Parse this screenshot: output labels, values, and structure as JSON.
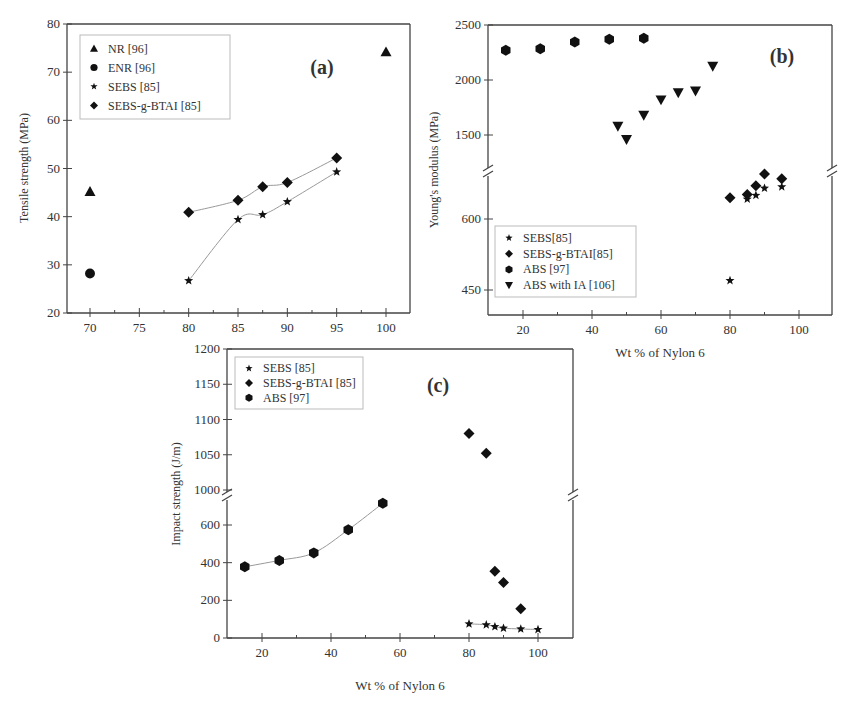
{
  "chart_data": [
    {
      "id": "a",
      "type": "scatter",
      "panel_label": "(a)",
      "title": "",
      "xlabel": "",
      "ylabel": "Tensile strength (MPa)",
      "xlim": [
        67.5,
        102.5
      ],
      "ylim": [
        20,
        80
      ],
      "xticks": [
        70,
        75,
        80,
        85,
        90,
        95,
        100
      ],
      "yticks": [
        20,
        30,
        40,
        50,
        60,
        70,
        80
      ],
      "grid": false,
      "legend_position": "upper-left",
      "series": [
        {
          "name": "NR [96]",
          "marker": "triangle-up",
          "points": [
            [
              70,
              45.2
            ],
            [
              100,
              74.2
            ]
          ]
        },
        {
          "name": "ENR [96]",
          "marker": "circle",
          "points": [
            [
              70,
              28.2
            ]
          ]
        },
        {
          "name": "SEBS [85]",
          "marker": "star",
          "points": [
            [
              80,
              26.7
            ],
            [
              85,
              39.4
            ],
            [
              87.5,
              40.4
            ],
            [
              90,
              43.1
            ],
            [
              95,
              49.3
            ]
          ],
          "fit_curve": true
        },
        {
          "name": "SEBS-g-BTAI [85]",
          "marker": "diamond",
          "points": [
            [
              80,
              40.9
            ],
            [
              85,
              43.4
            ],
            [
              87.5,
              46.2
            ],
            [
              90,
              47.1
            ],
            [
              95,
              52.2
            ]
          ],
          "fit_curve": true
        }
      ]
    },
    {
      "id": "b",
      "type": "scatter",
      "panel_label": "(b)",
      "title": "",
      "xlabel": "Wt % of Nylon 6",
      "ylabel": "Young's modulus (MPa)",
      "xlim": [
        10,
        110
      ],
      "ylim_broken": {
        "lower": [
          400,
          700
        ],
        "upper": [
          1300,
          2500
        ]
      },
      "xticks": [
        20,
        40,
        60,
        80,
        100
      ],
      "yticks": [
        450,
        600,
        1500,
        2000,
        2500
      ],
      "axis_break": true,
      "grid": false,
      "legend_position": "lower-left",
      "series": [
        {
          "name": "SEBS[85]",
          "marker": "star",
          "points": [
            [
              80,
              470
            ],
            [
              85,
              642
            ],
            [
              87.5,
              650
            ],
            [
              90,
              665
            ],
            [
              95,
              668
            ]
          ]
        },
        {
          "name": "SEBS-g-BTAI[85]",
          "marker": "diamond",
          "points": [
            [
              80,
              645
            ],
            [
              85,
              652
            ],
            [
              87.5,
              670
            ],
            [
              90,
              695
            ],
            [
              95,
              685
            ]
          ]
        },
        {
          "name": "ABS [97]",
          "marker": "hexagon",
          "points": [
            [
              15,
              2270
            ],
            [
              25,
              2285
            ],
            [
              35,
              2345
            ],
            [
              45,
              2370
            ],
            [
              55,
              2380
            ]
          ]
        },
        {
          "name": "ABS with IA [106]",
          "marker": "triangle-down",
          "points": [
            [
              47.5,
              1580
            ],
            [
              50,
              1460
            ],
            [
              55,
              1680
            ],
            [
              60,
              1820
            ],
            [
              65,
              1885
            ],
            [
              70,
              1900
            ],
            [
              75,
              2125
            ]
          ]
        }
      ]
    },
    {
      "id": "c",
      "type": "scatter",
      "panel_label": "(c)",
      "title": "",
      "xlabel": "Wt % of Nylon 6",
      "ylabel": "Impact strength (J/m)",
      "xlim": [
        10,
        110
      ],
      "ylim_broken": {
        "lower": [
          0,
          700
        ],
        "upper": [
          1000,
          1200
        ]
      },
      "xticks": [
        20,
        40,
        60,
        80,
        100
      ],
      "yticks": [
        0,
        200,
        400,
        600,
        1000,
        1050,
        1100,
        1150,
        1200
      ],
      "axis_break": true,
      "grid": false,
      "legend_position": "upper-left",
      "series": [
        {
          "name": "SEBS [85]",
          "marker": "star",
          "points": [
            [
              80,
              75
            ],
            [
              85,
              70
            ],
            [
              87.5,
              60
            ],
            [
              90,
              52
            ],
            [
              95,
              48
            ],
            [
              100,
              45
            ]
          ],
          "fit_curve": true
        },
        {
          "name": "SEBS-g-BTAI [85]",
          "marker": "diamond",
          "points": [
            [
              80,
              1080
            ],
            [
              85,
              1052
            ],
            [
              87.5,
              355
            ],
            [
              90,
              295
            ],
            [
              95,
              155
            ]
          ]
        },
        {
          "name": "ABS [97]",
          "marker": "hexagon",
          "points": [
            [
              15,
              378
            ],
            [
              25,
              412
            ],
            [
              35,
              452
            ],
            [
              45,
              575
            ],
            [
              55,
              715
            ]
          ],
          "fit_curve": true
        }
      ]
    }
  ]
}
